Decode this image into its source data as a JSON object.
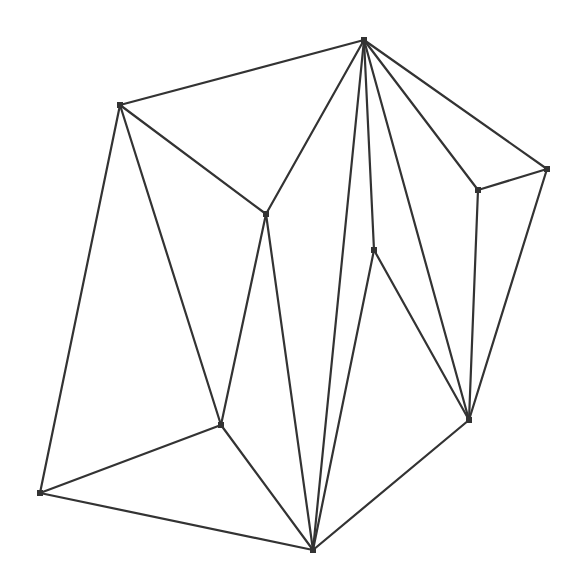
{
  "diagram": {
    "type": "planar-graph-triangulation",
    "width": 585,
    "height": 588,
    "background": "#ffffff",
    "stroke_color": "#333333",
    "node_size": 6,
    "nodes": [
      {
        "id": "A",
        "x": 120,
        "y": 105
      },
      {
        "id": "B",
        "x": 266,
        "y": 214
      },
      {
        "id": "C",
        "x": 364,
        "y": 40
      },
      {
        "id": "D",
        "x": 547,
        "y": 169
      },
      {
        "id": "E",
        "x": 478,
        "y": 190
      },
      {
        "id": "F",
        "x": 374,
        "y": 250
      },
      {
        "id": "G",
        "x": 221,
        "y": 425
      },
      {
        "id": "H",
        "x": 40,
        "y": 493
      },
      {
        "id": "I",
        "x": 313,
        "y": 550
      },
      {
        "id": "J",
        "x": 469,
        "y": 420
      }
    ],
    "edges": [
      [
        "A",
        "C"
      ],
      [
        "A",
        "B"
      ],
      [
        "A",
        "H"
      ],
      [
        "A",
        "G"
      ],
      [
        "B",
        "C"
      ],
      [
        "B",
        "G"
      ],
      [
        "B",
        "I"
      ],
      [
        "C",
        "I"
      ],
      [
        "C",
        "F"
      ],
      [
        "C",
        "J"
      ],
      [
        "C",
        "E"
      ],
      [
        "C",
        "D"
      ],
      [
        "D",
        "E"
      ],
      [
        "D",
        "J"
      ],
      [
        "E",
        "J"
      ],
      [
        "F",
        "I"
      ],
      [
        "F",
        "J"
      ],
      [
        "G",
        "H"
      ],
      [
        "G",
        "I"
      ],
      [
        "H",
        "I"
      ],
      [
        "I",
        "J"
      ]
    ]
  }
}
